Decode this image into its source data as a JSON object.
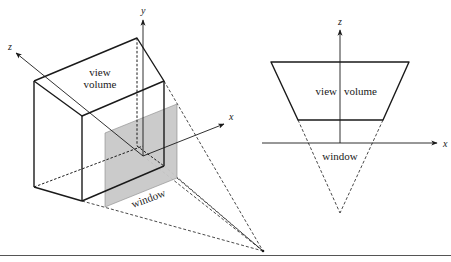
{
  "left_diagram": {
    "labels": {
      "y_axis": "y",
      "z_axis": "z",
      "x_axis": "x",
      "view_volume_line1": "view",
      "view_volume_line2": "volume",
      "window": "window"
    }
  },
  "right_diagram": {
    "labels": {
      "z_axis": "z",
      "x_axis": "x",
      "view_volume_left": "view",
      "view_volume_right": "volume",
      "window": "window"
    }
  },
  "colors": {
    "line": "#1a1a1a",
    "window_fill": "#c8c8c8",
    "background": "#ffffff",
    "baseline": "#555555"
  }
}
